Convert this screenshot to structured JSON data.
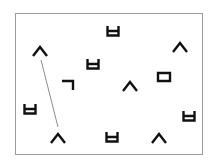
{
  "diagram": {
    "frame": {
      "x": 15,
      "y": 13,
      "width": 188,
      "height": 142,
      "border_color": "#9a9a9a"
    },
    "glyph_color": "#111111",
    "connector_color": "#8c8c8c",
    "symbols": [
      {
        "char": "ㅂ",
        "shape": "bieup",
        "cx": 113,
        "cy": 31
      },
      {
        "char": "ㅅ",
        "shape": "siot",
        "cx": 40,
        "cy": 51
      },
      {
        "char": "ㅅ",
        "shape": "siot",
        "cx": 180,
        "cy": 47
      },
      {
        "char": "ㅂ",
        "shape": "bieup",
        "cx": 93,
        "cy": 64
      },
      {
        "char": "ㄱ",
        "shape": "giyeok",
        "cx": 68,
        "cy": 85
      },
      {
        "char": "ㅅ",
        "shape": "siot",
        "cx": 130,
        "cy": 86
      },
      {
        "char": "ㅁ",
        "shape": "mieum",
        "cx": 164,
        "cy": 77
      },
      {
        "char": "ㅂ",
        "shape": "bieup",
        "cx": 30,
        "cy": 109
      },
      {
        "char": "ㅂ",
        "shape": "bieup",
        "cx": 189,
        "cy": 116
      },
      {
        "char": "ㅅ",
        "shape": "siot",
        "cx": 58,
        "cy": 138
      },
      {
        "char": "ㅂ",
        "shape": "bieup",
        "cx": 112,
        "cy": 137
      },
      {
        "char": "ㅅ",
        "shape": "siot",
        "cx": 159,
        "cy": 138
      }
    ],
    "connectors": [
      {
        "from_index": 1,
        "to_index": 9,
        "x1": 41,
        "y1": 60,
        "x2": 58,
        "y2": 127
      }
    ]
  }
}
